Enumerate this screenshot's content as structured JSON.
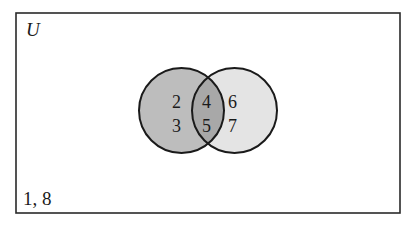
{
  "diagram": {
    "type": "venn",
    "universe_label": "U",
    "outside_elements": "1, 8",
    "sets": [
      {
        "name": "left-set",
        "fill": "#bdbdbd"
      },
      {
        "name": "right-set",
        "fill": "#e4e4e4"
      }
    ],
    "intersection_fill": "#a8a8a8",
    "regions": {
      "left_only": [
        "2",
        "3"
      ],
      "intersection": [
        "4",
        "5"
      ],
      "right_only": [
        "6",
        "7"
      ]
    },
    "stroke_color": "#1a1a1a"
  }
}
